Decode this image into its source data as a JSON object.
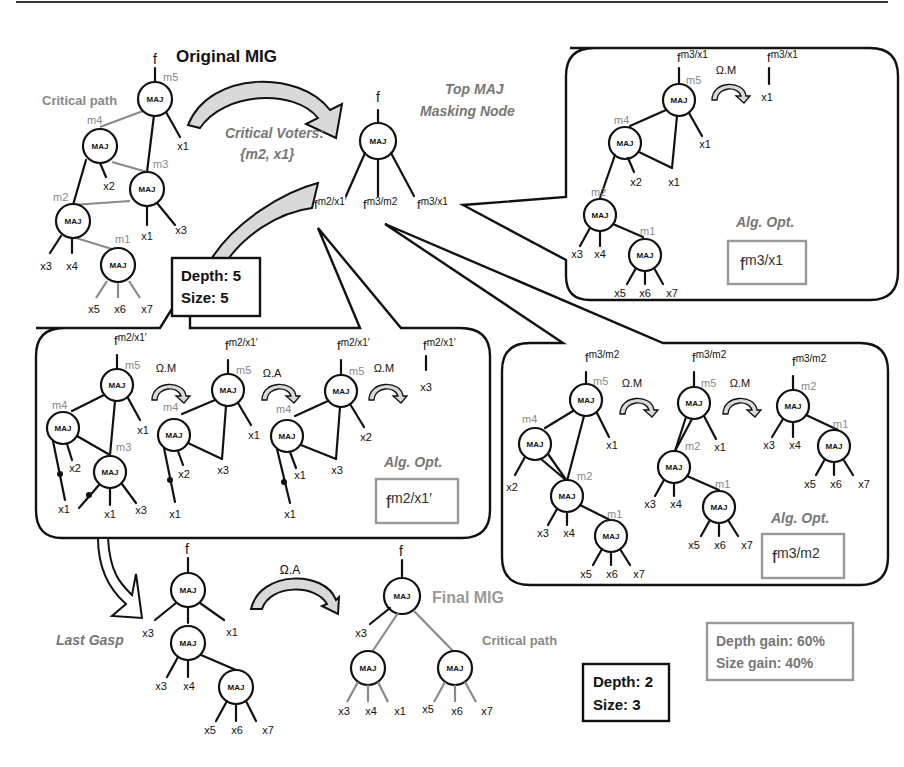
{
  "titles": {
    "original_mig": "Original MIG",
    "final_mig": "Final MIG",
    "critical_path_top": "Critical path",
    "critical_path_bottom": "Critical path",
    "critical_voters_line1": "Critical Voters:",
    "critical_voters_line2": "{m2, x1}",
    "top_maj_line1": "Top MAJ",
    "top_maj_line2": "Masking Node",
    "last_gasp": "Last Gasp"
  },
  "node_label": "MAJ",
  "output_f": "f",
  "original_mig": {
    "nodes": [
      "m5",
      "m4",
      "m3",
      "m2",
      "m1"
    ],
    "inputs": [
      "x1",
      "x2",
      "x1",
      "x3",
      "x3",
      "x4",
      "x5",
      "x6",
      "x7"
    ]
  },
  "masking_node": {
    "outputs": [
      {
        "base": "f",
        "sup": "m2/x1′"
      },
      {
        "base": "f",
        "sup": "m3/m2"
      },
      {
        "base": "f",
        "sup": "m3/x1"
      }
    ]
  },
  "stats_original": {
    "depth": "Depth: 5",
    "size": "Size: 5"
  },
  "stats_final": {
    "depth": "Depth: 2",
    "size": "Size: 3"
  },
  "gain": {
    "depth": "Depth gain: 60%",
    "size": "Size gain: 40%"
  },
  "bubbles": {
    "m3x1": {
      "f_sup": "m3/x1",
      "transform": "Ω.M",
      "result_input": "x1",
      "alg_opt": "Alg. Opt.",
      "result_base": "f",
      "result_sup": "m3/x1"
    },
    "m2x1": {
      "f_sup": "m2/x1′",
      "transforms": [
        "Ω.M",
        "Ω.A",
        "Ω.M"
      ],
      "result_input": "x3",
      "alg_opt": "Alg. Opt.",
      "result_base": "f",
      "result_sup": "m2/x1′"
    },
    "m3m2": {
      "f_sup": "m3/m2",
      "transforms": [
        "Ω.M",
        "Ω.M"
      ],
      "alg_opt": "Alg. Opt.",
      "result_base": "f",
      "result_sup": "m3/m2"
    }
  },
  "last_gasp": {
    "transform": "Ω.A"
  },
  "labels": {
    "m1": "m1",
    "m2": "m2",
    "m3": "m3",
    "m4": "m4",
    "m5": "m5",
    "x1": "x1",
    "x2": "x2",
    "x3": "x3",
    "x4": "x4",
    "x5": "x5",
    "x6": "x6",
    "x7": "x7"
  }
}
